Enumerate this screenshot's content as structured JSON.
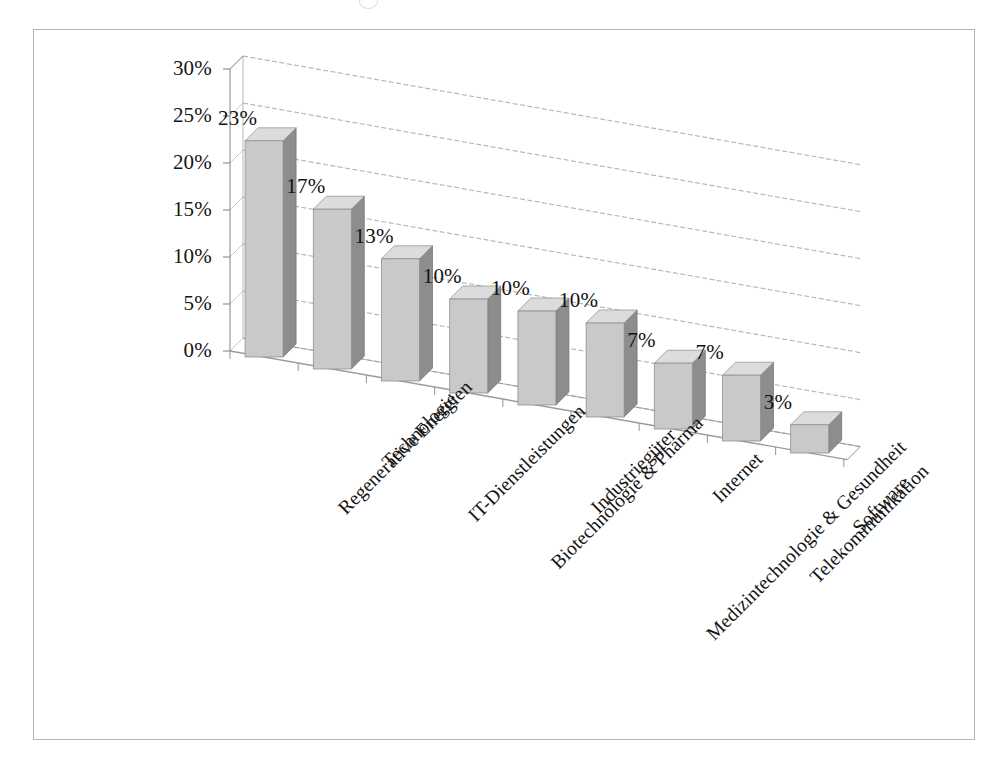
{
  "chart": {
    "title": "",
    "frame_border_color": "#b4b4b4",
    "background": "#ffffff",
    "bar_front_color": "#c9c9c9",
    "bar_side_color": "#8d8d8d",
    "bar_top_color": "#dcdcdc",
    "gridline_color": "#9a9a9a",
    "axis_color": "#8a8a8a",
    "text_color": "#151515"
  },
  "chart_data": {
    "type": "bar",
    "title": "",
    "subtitle": "",
    "xlabel": "",
    "ylabel": "",
    "categories": [
      "Regenerative Energien",
      "Technologie",
      "IT-Dienstleistungen",
      "Biotechnologie & Pharma",
      "Industriegüter",
      "Medizintechnologie & Gesundheit",
      "Internet",
      "Telekommunikation",
      "Software"
    ],
    "values": [
      23,
      17,
      13,
      10,
      10,
      10,
      7,
      7,
      3
    ],
    "value_labels": [
      "23%",
      "17%",
      "13%",
      "10%",
      "10%",
      "10%",
      "7%",
      "7%",
      "3%"
    ],
    "ylim": [
      0,
      30
    ],
    "ytick_values": [
      0,
      5,
      10,
      15,
      20,
      25,
      30
    ],
    "ytick_labels": [
      "0%",
      "5%",
      "10%",
      "15%",
      "20%",
      "25%",
      "30%"
    ],
    "grid": true,
    "legend": "none",
    "three_d": true,
    "unit": "%"
  }
}
